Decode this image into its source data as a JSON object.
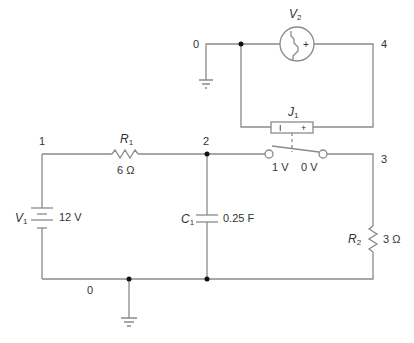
{
  "diagram": {
    "type": "circuit-schematic",
    "wire_color": "#8a8a8a",
    "junction_color": "#111111",
    "nodes": {
      "n0_top": "0",
      "n1": "1",
      "n2": "2",
      "n3": "3",
      "n4": "4",
      "n0_bottom": "0"
    },
    "components": {
      "V1": {
        "name": "V",
        "sub": "1",
        "value": "12 V",
        "kind": "dc-voltage-source"
      },
      "R1": {
        "name": "R",
        "sub": "1",
        "value": "6 Ω",
        "kind": "resistor"
      },
      "C1": {
        "name": "C",
        "sub": "1",
        "value": "0.25 F",
        "kind": "capacitor"
      },
      "R2": {
        "name": "R",
        "sub": "2",
        "value": "3 Ω",
        "kind": "resistor"
      },
      "V2": {
        "name": "V",
        "sub": "2",
        "kind": "step-voltage-source",
        "plus": "+"
      },
      "J1": {
        "name": "J",
        "sub": "1",
        "kind": "voltage-controlled-switch",
        "minus": "I",
        "plus": "+",
        "on_label": "1 V",
        "off_label": "0 V"
      }
    }
  }
}
